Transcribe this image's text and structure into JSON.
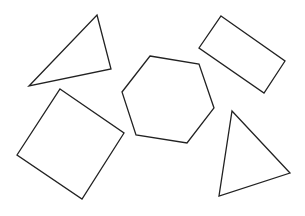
{
  "canvas": {
    "width": 305,
    "height": 216,
    "background": "#ffffff",
    "stroke": "#222222"
  },
  "shapes": [
    {
      "name": "triangle-top-left",
      "type": "triangle",
      "points": "97,15 111,69 29,86"
    },
    {
      "name": "rectangle-top-right",
      "type": "rectangle",
      "points": "221,16 285,61 264,93 199,48"
    },
    {
      "name": "hexagon-center",
      "type": "hexagon",
      "points": "150,56 199,64 214,108 187,143 136,135 122,92"
    },
    {
      "name": "square-bottom-left",
      "type": "square",
      "points": "60,89 124,133 82,199 17,155"
    },
    {
      "name": "triangle-bottom-right",
      "type": "triangle",
      "points": "232,111 290,173 219,196"
    }
  ]
}
